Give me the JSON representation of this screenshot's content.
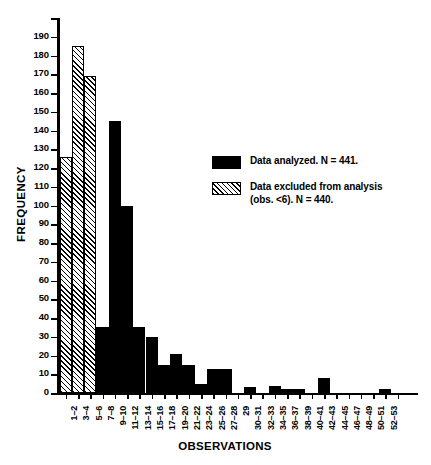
{
  "chart_data": {
    "type": "bar",
    "title": "",
    "xlabel": "OBSERVATIONS",
    "ylabel": "FREQUENCY",
    "ylim": [
      0,
      200
    ],
    "ytick_labels": [
      "0",
      "10",
      "20",
      "30",
      "40",
      "50",
      "60",
      "70",
      "80",
      "90",
      "100",
      "110",
      "120",
      "130",
      "140",
      "150",
      "160",
      "170",
      "180",
      "190",
      "200"
    ],
    "ytick_values": [
      0,
      10,
      20,
      30,
      40,
      50,
      60,
      70,
      80,
      90,
      100,
      110,
      120,
      130,
      140,
      150,
      160,
      170,
      180,
      190,
      200
    ],
    "grid": false,
    "categories": [
      "1–2",
      "3–4",
      "5–6",
      "7–8",
      "9–10",
      "11–12",
      "13–14",
      "15–16",
      "17–18",
      "19–20",
      "21–22",
      "23–24",
      "25–26",
      "27–28",
      "29",
      "30–31",
      "32–33",
      "34–35",
      "36–37",
      "38–39",
      "40–41",
      "42–43",
      "44–45",
      "46–47",
      "48–49",
      "50–51",
      "52–53"
    ],
    "values": [
      126,
      185,
      169,
      35,
      145,
      100,
      35,
      30,
      15,
      21,
      15,
      5,
      13,
      13,
      0,
      3,
      0,
      4,
      2,
      2,
      0,
      8,
      0,
      0,
      0,
      0,
      2
    ],
    "fills": [
      "hatch",
      "hatch",
      "hatch",
      "solid",
      "solid",
      "solid",
      "solid",
      "solid",
      "solid",
      "solid",
      "solid",
      "solid",
      "solid",
      "solid",
      "solid",
      "solid",
      "solid",
      "solid",
      "solid",
      "solid",
      "solid",
      "solid",
      "solid",
      "solid",
      "solid",
      "solid",
      "solid"
    ],
    "legend_position": "upper right",
    "legend": [
      {
        "fill": "solid",
        "label": "Data analyzed.  N = 441."
      },
      {
        "fill": "hatch",
        "label": "Data excluded from analysis\n(obs. <6).  N = 440."
      }
    ],
    "colors": {
      "series_analyzed": "#000000",
      "series_excluded_fill": "#ffffff",
      "series_excluded_hatch": "#000000",
      "axis": "#000000",
      "background": "#ffffff"
    }
  }
}
